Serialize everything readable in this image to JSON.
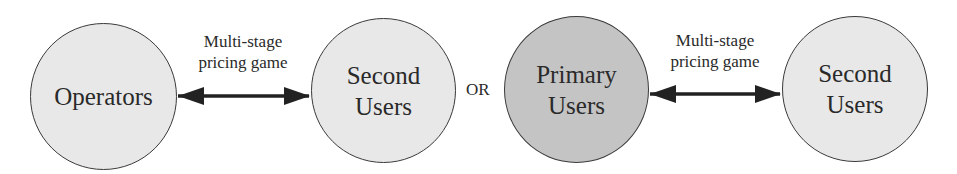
{
  "diagram": {
    "left_group": {
      "nodes": [
        {
          "id": "operators",
          "lines": [
            "Operators"
          ],
          "fill": "#e8e8e8"
        },
        {
          "id": "second-users-1",
          "lines": [
            "Second",
            "Users"
          ],
          "fill": "#e8e8e8"
        }
      ],
      "edge": {
        "from": "operators",
        "to": "second-users-1",
        "type": "bidirectional",
        "label_lines": [
          "Multi-stage",
          "pricing game"
        ]
      }
    },
    "separator": "OR",
    "right_group": {
      "nodes": [
        {
          "id": "primary-users",
          "lines": [
            "Primary",
            "Users"
          ],
          "fill": "#c4c4c4"
        },
        {
          "id": "second-users-2",
          "lines": [
            "Second",
            "Users"
          ],
          "fill": "#e8e8e8"
        }
      ],
      "edge": {
        "from": "primary-users",
        "to": "second-users-2",
        "type": "bidirectional",
        "label_lines": [
          "Multi-stage",
          "pricing game"
        ]
      }
    }
  }
}
